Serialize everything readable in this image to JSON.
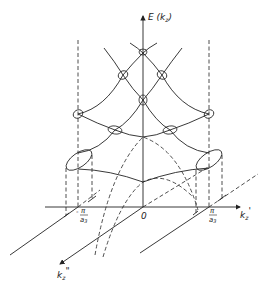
{
  "figure": {
    "type": "band-structure-sketch",
    "axes": {
      "vertical": {
        "label": "E (k",
        "sub": "z",
        "close": ")"
      },
      "horizontal": {
        "label": "k",
        "sub": "z",
        "prime": "'"
      },
      "oblique": {
        "label": "k",
        "sub": "z",
        "prime": "\""
      }
    },
    "ticks": {
      "origin": "0",
      "left": {
        "sign": "-",
        "num": "π",
        "den": "a",
        "den_sub": "3"
      },
      "right": {
        "sign": "",
        "num": "π",
        "den": "a",
        "den_sub": "3"
      }
    },
    "colors": {
      "ink": "#222222",
      "background": "#ffffff"
    }
  }
}
